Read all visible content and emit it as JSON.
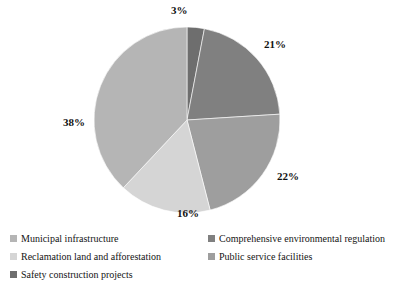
{
  "chart_data": {
    "type": "pie",
    "title": "",
    "labels": [
      "Safety construction projects",
      "Comprehensive environmental regulation",
      "Public service facilities",
      "Reclamation land and afforestation",
      "Municipal infrastructure"
    ],
    "values": [
      3,
      21,
      22,
      16,
      38
    ],
    "value_labels": [
      "3%",
      "21%",
      "22%",
      "16%",
      "38%"
    ],
    "unit": "%",
    "colors": [
      "#6e6e6e",
      "#808080",
      "#9e9e9e",
      "#d5d5d5",
      "#b5b5b5"
    ],
    "start_angle_deg": 0,
    "direction": "clockwise",
    "legend_position": "bottom",
    "grid": false
  },
  "pie": {
    "center_x": 187,
    "center_y": 120,
    "radius": 93,
    "slices": [
      {
        "name": "safety-construction-projects",
        "percent": 3,
        "label": "3%",
        "color": "#6e6e6e",
        "label_x": 171,
        "label_y": 4
      },
      {
        "name": "comprehensive-environmental-regulation",
        "percent": 21,
        "label": "21%",
        "color": "#808080",
        "label_x": 264,
        "label_y": 38
      },
      {
        "name": "public-service-facilities",
        "percent": 22,
        "label": "22%",
        "color": "#9e9e9e",
        "label_x": 277,
        "label_y": 170
      },
      {
        "name": "reclamation-land-and-afforestation",
        "percent": 16,
        "label": "16%",
        "color": "#d5d5d5",
        "label_x": 177,
        "label_y": 207
      },
      {
        "name": "municipal-infrastructure",
        "percent": 38,
        "label": "38%",
        "color": "#b5b5b5",
        "label_x": 63,
        "label_y": 116
      }
    ]
  },
  "legend": {
    "items": [
      {
        "label": "Municipal infrastructure",
        "color": "#b5b5b5",
        "column": "left",
        "row": 1
      },
      {
        "label": "Comprehensive environmental regulation",
        "color": "#808080",
        "column": "right",
        "row": 1
      },
      {
        "label": "Reclamation land and afforestation",
        "color": "#d5d5d5",
        "column": "left",
        "row": 2
      },
      {
        "label": "Public service facilities",
        "color": "#9e9e9e",
        "column": "right",
        "row": 2
      },
      {
        "label": "Safety construction projects",
        "color": "#6e6e6e",
        "column": "left",
        "row": 3
      }
    ]
  }
}
